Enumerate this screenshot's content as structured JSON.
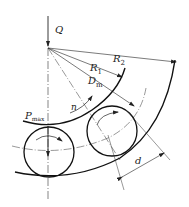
{
  "diagram": {
    "title": "",
    "type": "rolling bearing geometry",
    "labels": {
      "load": "Q",
      "outer_radius": "R",
      "outer_radius_sub": "2",
      "inner_radius": "R",
      "inner_radius_sub": "1",
      "pitch_diameter": "D",
      "pitch_diameter_sub": "m",
      "rotation": "n",
      "max_load": "P",
      "max_load_sub": "max",
      "ball_diameter": "d"
    },
    "colors": {
      "stroke": "#222222",
      "background": "#ffffff"
    }
  }
}
